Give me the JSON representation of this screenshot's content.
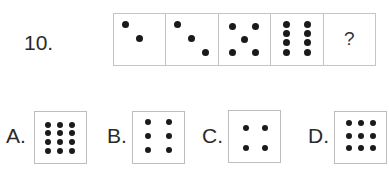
{
  "question": {
    "number_label": "10.",
    "sequence": [
      {
        "count": 2,
        "dots": [
          [
            11,
            10
          ],
          [
            25,
            24
          ]
        ]
      },
      {
        "count": 3,
        "dots": [
          [
            11,
            10
          ],
          [
            25,
            24
          ],
          [
            39,
            38
          ]
        ]
      },
      {
        "count": 5,
        "dots": [
          [
            14,
            12
          ],
          [
            37,
            12
          ],
          [
            26,
            25
          ],
          [
            14,
            38
          ],
          [
            37,
            38
          ]
        ]
      },
      {
        "count": 8,
        "dots": [
          [
            15,
            10
          ],
          [
            36,
            10
          ],
          [
            15,
            19
          ],
          [
            36,
            19
          ],
          [
            15,
            28
          ],
          [
            36,
            28
          ],
          [
            15,
            38
          ],
          [
            36,
            38
          ]
        ]
      },
      {
        "count": null,
        "placeholder": "?"
      }
    ]
  },
  "options": [
    {
      "letter": "A.",
      "count": 12,
      "dots": [
        [
          13,
          13
        ],
        [
          25,
          13
        ],
        [
          37,
          13
        ],
        [
          13,
          21
        ],
        [
          25,
          21
        ],
        [
          37,
          21
        ],
        [
          13,
          30
        ],
        [
          25,
          30
        ],
        [
          37,
          30
        ],
        [
          13,
          39
        ],
        [
          25,
          39
        ],
        [
          37,
          39
        ]
      ]
    },
    {
      "letter": "B.",
      "count": 6,
      "dots": [
        [
          15,
          10
        ],
        [
          36,
          10
        ],
        [
          15,
          24
        ],
        [
          36,
          24
        ],
        [
          15,
          38
        ],
        [
          36,
          38
        ]
      ]
    },
    {
      "letter": "C.",
      "count": 4,
      "dots": [
        [
          17,
          17
        ],
        [
          36,
          17
        ],
        [
          17,
          37
        ],
        [
          36,
          37
        ]
      ]
    },
    {
      "letter": "D.",
      "count": 9,
      "dots": [
        [
          14,
          11
        ],
        [
          26,
          11
        ],
        [
          38,
          11
        ],
        [
          14,
          24
        ],
        [
          26,
          24
        ],
        [
          38,
          24
        ],
        [
          14,
          36
        ],
        [
          26,
          36
        ],
        [
          38,
          36
        ]
      ]
    }
  ],
  "colors": {
    "dot": "#1a1a1a",
    "border": "#c4c4c4",
    "text": "#2a2a2a"
  }
}
